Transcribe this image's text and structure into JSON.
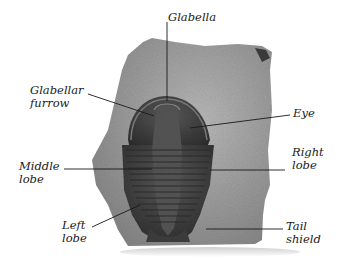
{
  "diagram": {
    "labels": [
      {
        "id": "glabella",
        "text": "Glabella",
        "x": 168,
        "y": 11
      },
      {
        "id": "glabellar-furrow",
        "text": "Glabellar\nfurrow",
        "x": 30,
        "y": 84
      },
      {
        "id": "eye",
        "text": "Eye",
        "x": 293,
        "y": 107
      },
      {
        "id": "middle-lobe",
        "text": "Middle\nlobe",
        "x": 19,
        "y": 160
      },
      {
        "id": "right-lobe",
        "text": "Right\nlobe",
        "x": 292,
        "y": 146
      },
      {
        "id": "left-lobe",
        "text": "Left\nlobe",
        "x": 62,
        "y": 219
      },
      {
        "id": "tail-shield",
        "text": "Tail\nshield",
        "x": 286,
        "y": 220
      }
    ],
    "colors": {
      "background": "#ffffff",
      "rock": "#9a9a9a",
      "rock_light": "#bdbdbd",
      "fossil": "#4a4a4a",
      "fossil_dark": "#2c2c2c",
      "leader_line": "#1a1a1a",
      "text": "#1a1a1a"
    }
  }
}
